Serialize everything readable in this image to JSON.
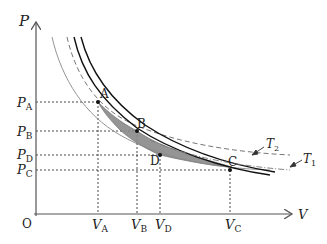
{
  "diagram": {
    "type": "P-V diagram (thermodynamic cycle between isotherms)",
    "axes": {
      "y_label": "P",
      "x_label": "V",
      "origin_label": "O"
    },
    "y_ticks": [
      {
        "main": "P",
        "sub": "A"
      },
      {
        "main": "P",
        "sub": "B"
      },
      {
        "main": "P",
        "sub": "D"
      },
      {
        "main": "P",
        "sub": "C"
      }
    ],
    "x_ticks": [
      {
        "main": "V",
        "sub": "A"
      },
      {
        "main": "V",
        "sub": "B"
      },
      {
        "main": "V",
        "sub": "D"
      },
      {
        "main": "V",
        "sub": "C"
      }
    ],
    "points": [
      {
        "label": "A"
      },
      {
        "label": "B"
      },
      {
        "label": "C"
      },
      {
        "label": "D"
      }
    ],
    "curves": [
      {
        "label_main": "T",
        "label_sub": "2",
        "style": "dashed"
      },
      {
        "label_main": "T",
        "label_sub": "1",
        "style": "dash-dot"
      }
    ],
    "colors": {
      "axis": "#555555",
      "curve_dark": "#111111",
      "curve_gray": "#888888",
      "shade": "#8a8a8a",
      "guide": "#333333"
    }
  }
}
